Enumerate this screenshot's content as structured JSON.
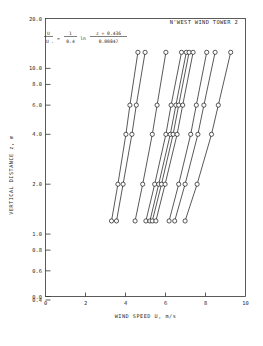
{
  "chart_data": {
    "type": "line",
    "title": "N'WEST WIND TOWER 2",
    "xlabel": "WIND SPEED U, m/s",
    "ylabel": "VERTICAL DISTANCE z, m",
    "xlim": [
      0,
      10
    ],
    "ylim": [
      0.4,
      20.0
    ],
    "yscale": "log",
    "grid": false,
    "legend": null,
    "xticks": [
      "0",
      "2",
      "4",
      "6",
      "8",
      "10"
    ],
    "xtick_values": [
      0,
      2,
      4,
      6,
      8,
      10
    ],
    "yticks": [
      "20.0",
      "10.0",
      "8.0",
      "6.0",
      "4.0",
      "2.0",
      "1.0",
      "0.8",
      "0.6",
      "0.4",
      "0.0"
    ],
    "ytick_values": [
      20.0,
      10.0,
      8.0,
      6.0,
      4.0,
      2.0,
      1.0,
      0.8,
      0.6,
      0.4,
      0.42
    ],
    "annotation": {
      "text": "U/U* = (1/0.4) ln[(z + 0.436)/0.00847]",
      "numerator_left": "U",
      "denominator_left": "U",
      "denominator_left_sub": "*",
      "equals": "=",
      "numerator_mid": "1",
      "denominator_mid": "0.4",
      "ln": "ln",
      "numerator_right": "z + 0.436",
      "denominator_right": "0.00847"
    },
    "marker": "open-circle",
    "y_values": [
      1.2,
      2.0,
      4.0,
      6.0,
      12.5
    ],
    "series": [
      {
        "name": "profile-1",
        "y": [
          1.2,
          2.0,
          4.0,
          6.0,
          12.5
        ],
        "values": [
          3.3,
          3.62,
          4.02,
          4.22,
          4.62
        ]
      },
      {
        "name": "profile-2",
        "y": [
          1.2,
          2.0,
          4.0,
          6.0,
          12.5
        ],
        "values": [
          3.55,
          3.88,
          4.32,
          4.54,
          4.98
        ]
      },
      {
        "name": "profile-3",
        "y": [
          1.2,
          2.0,
          4.0,
          6.0,
          12.5
        ],
        "values": [
          4.48,
          4.86,
          5.34,
          5.58,
          6.02
        ]
      },
      {
        "name": "profile-4",
        "y": [
          1.2,
          2.0,
          4.0,
          6.0,
          12.5
        ],
        "values": [
          5.02,
          5.46,
          6.02,
          6.28,
          6.8
        ]
      },
      {
        "name": "profile-5",
        "y": [
          1.2,
          2.0,
          4.0,
          6.0,
          12.5
        ],
        "values": [
          5.22,
          5.66,
          6.24,
          6.52,
          7.04
        ]
      },
      {
        "name": "profile-6",
        "y": [
          1.2,
          2.0,
          4.0,
          6.0,
          12.5
        ],
        "values": [
          5.34,
          5.8,
          6.38,
          6.66,
          7.18
        ]
      },
      {
        "name": "profile-7",
        "y": [
          1.2,
          2.0,
          4.0,
          6.0,
          12.5
        ],
        "values": [
          5.52,
          5.98,
          6.58,
          6.86,
          7.38
        ]
      },
      {
        "name": "profile-8",
        "y": [
          1.2,
          2.0,
          4.0,
          6.0,
          12.5
        ],
        "values": [
          6.18,
          6.66,
          7.26,
          7.54,
          8.06
        ]
      },
      {
        "name": "profile-9",
        "y": [
          1.2,
          2.0,
          4.0,
          6.0,
          12.5
        ],
        "values": [
          6.46,
          6.98,
          7.62,
          7.92,
          8.48
        ]
      },
      {
        "name": "profile-10",
        "y": [
          1.2,
          2.0,
          4.0,
          6.0,
          12.5
        ],
        "values": [
          6.98,
          7.58,
          8.3,
          8.64,
          9.26
        ]
      }
    ]
  }
}
